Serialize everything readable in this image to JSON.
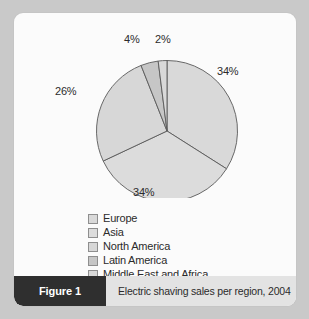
{
  "figure": {
    "tag_label": "Figure 1",
    "caption": "Electric shaving sales per region, 2004"
  },
  "chart_data": {
    "type": "pie",
    "title": "Electric shaving sales per region, 2004",
    "categories": [
      "Europe",
      "Asia",
      "North America",
      "Latin America",
      "Middle East and Africa"
    ],
    "values": [
      34,
      34,
      26,
      4,
      2
    ],
    "unit": "%",
    "data_labels": [
      "34%",
      "34%",
      "26%",
      "4%",
      "2%"
    ],
    "start_angle_deg": 0,
    "direction": "clockwise",
    "legend_position": "bottom",
    "grid": false,
    "slice_colors": [
      "#d9d9d9",
      "#dcdcdc",
      "#d7d7d7",
      "#c6c6c6",
      "#d9d9d9"
    ],
    "slice_border_color": "#595959"
  },
  "legend": {
    "items": [
      {
        "label": "Europe",
        "swatch": "#d9d9d9"
      },
      {
        "label": "Asia",
        "swatch": "#dcdcdc"
      },
      {
        "label": "North America",
        "swatch": "#d7d7d7"
      },
      {
        "label": "Latin America",
        "swatch": "#c6c6c6"
      },
      {
        "label": "Middle East and Africa",
        "swatch": "#d9d9d9"
      }
    ]
  },
  "labels": {
    "europe": "34%",
    "asia": "34%",
    "north_america": "26%",
    "latin_america": "4%",
    "middle_east_africa": "2%"
  }
}
